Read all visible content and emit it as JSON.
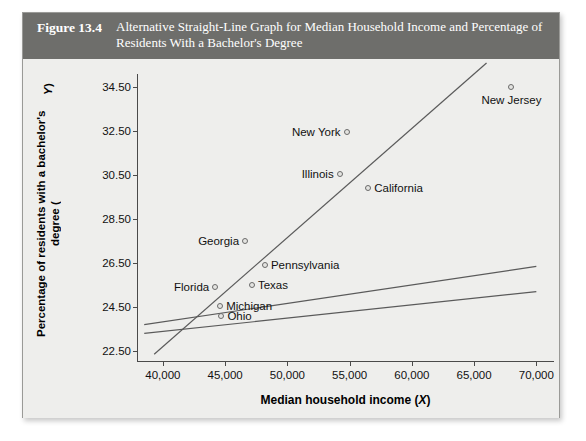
{
  "figure": {
    "number": "Figure 13.4",
    "caption": "Alternative Straight-Line Graph for Median Household Income and Percentage of Residents With a Bachelor's Degree"
  },
  "chart_data": {
    "type": "scatter",
    "title": "Alternative Straight-Line Graph for Median Household Income and Percentage of Residents With a Bachelor's Degree",
    "xlabel": "Median household income (X)",
    "ylabel": "Percentage of residents with a bachelor's degree (Y)",
    "xlim": [
      38000,
      71500
    ],
    "ylim": [
      22.0,
      35.1
    ],
    "grid": false,
    "legend": "none",
    "xticks": [
      40000,
      45000,
      50000,
      55000,
      60000,
      65000,
      70000
    ],
    "xticklabels": [
      "40,000",
      "45,000",
      "50,000",
      "55,000",
      "60,000",
      "65,000",
      "70,000"
    ],
    "yticks": [
      22.5,
      24.5,
      26.5,
      28.5,
      30.5,
      32.5,
      34.5
    ],
    "yticklabels": [
      "22.50",
      "24.50",
      "26.50",
      "28.50",
      "30.50",
      "32.50",
      "34.50"
    ],
    "points": [
      {
        "label": "New Jersey",
        "x": 68000,
        "y": 34.5,
        "label_pos": "right"
      },
      {
        "label": "New York",
        "x": 54750,
        "y": 32.45,
        "label_pos": "left"
      },
      {
        "label": "Illinois",
        "x": 54200,
        "y": 30.55,
        "label_pos": "left"
      },
      {
        "label": "California",
        "x": 56500,
        "y": 29.9,
        "label_pos": "right"
      },
      {
        "label": "Georgia",
        "x": 46600,
        "y": 27.5,
        "label_pos": "left"
      },
      {
        "label": "Pennsylvania",
        "x": 48200,
        "y": 26.4,
        "label_pos": "right"
      },
      {
        "label": "Texas",
        "x": 47150,
        "y": 25.5,
        "label_pos": "right"
      },
      {
        "label": "Florida",
        "x": 44200,
        "y": 25.4,
        "label_pos": "left"
      },
      {
        "label": "Michigan",
        "x": 44600,
        "y": 24.55,
        "label_pos": "right"
      },
      {
        "label": "Ohio",
        "x": 44700,
        "y": 24.1,
        "label_pos": "right"
      }
    ],
    "lines": [
      {
        "name": "steep-line",
        "x1": 39300,
        "y1": 22.35,
        "x2": 66000,
        "y2": 35.6
      },
      {
        "name": "middle-shallow-line",
        "x1": 38500,
        "y1": 23.7,
        "x2": 70000,
        "y2": 26.35
      },
      {
        "name": "lower-shallow-line",
        "x1": 38500,
        "y1": 23.3,
        "x2": 70000,
        "y2": 25.2
      }
    ],
    "line_color": "#5a5a5a",
    "point_color": "#6a6a6a",
    "background": "#eeeeec",
    "header_color": "#6e6e6b"
  }
}
